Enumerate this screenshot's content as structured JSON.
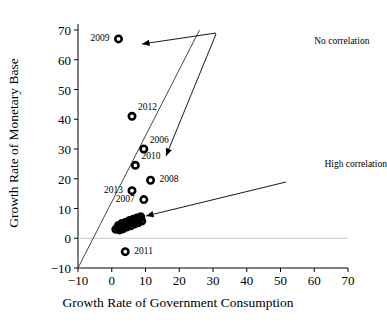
{
  "chart_data": {
    "type": "scatter",
    "title": "",
    "xlabel": "Growth Rate of Government Consumption",
    "ylabel": "Growth Rate of Monetary Base",
    "xlim": [
      -10,
      70
    ],
    "ylim": [
      -10,
      70
    ],
    "xticks": [
      "−10",
      "0",
      "10",
      "20",
      "30",
      "40",
      "50",
      "60",
      "70"
    ],
    "yticks": [
      "−10",
      "0",
      "10",
      "20",
      "30",
      "40",
      "50",
      "60",
      "70"
    ],
    "xtick_values": [
      -10,
      0,
      10,
      20,
      30,
      40,
      50,
      60,
      70
    ],
    "ytick_values": [
      -10,
      0,
      10,
      20,
      30,
      40,
      50,
      60,
      70
    ],
    "grid": false,
    "legend": "none",
    "marker": "open-circle",
    "marker_color": "#000000",
    "labeled_points": [
      {
        "label": "2009",
        "x": 2.0,
        "y": 67.0,
        "label_pos": "left"
      },
      {
        "label": "2012",
        "x": 6.0,
        "y": 41.0,
        "label_pos": "upper-right"
      },
      {
        "label": "2006",
        "x": 9.5,
        "y": 30.0,
        "label_pos": "upper-right"
      },
      {
        "label": "2010",
        "x": 7.0,
        "y": 24.5,
        "label_pos": "upper-right"
      },
      {
        "label": "2008",
        "x": 11.5,
        "y": 19.5,
        "label_pos": "right"
      },
      {
        "label": "2013",
        "x": 6.0,
        "y": 16.0,
        "label_pos": "left"
      },
      {
        "label": "2007",
        "x": 9.5,
        "y": 13.0,
        "label_pos": "left"
      },
      {
        "label": "2011",
        "x": 4.0,
        "y": -4.5,
        "label_pos": "right"
      }
    ],
    "cluster_points": [
      {
        "x": 1.2,
        "y": 3.0
      },
      {
        "x": 1.9,
        "y": 3.4
      },
      {
        "x": 2.4,
        "y": 2.8
      },
      {
        "x": 2.0,
        "y": 4.3
      },
      {
        "x": 2.8,
        "y": 4.0
      },
      {
        "x": 3.3,
        "y": 3.2
      },
      {
        "x": 3.0,
        "y": 5.0
      },
      {
        "x": 3.8,
        "y": 4.6
      },
      {
        "x": 4.4,
        "y": 3.8
      },
      {
        "x": 4.2,
        "y": 5.4
      },
      {
        "x": 5.0,
        "y": 5.0
      },
      {
        "x": 5.6,
        "y": 4.2
      },
      {
        "x": 5.3,
        "y": 6.0
      },
      {
        "x": 6.1,
        "y": 5.6
      },
      {
        "x": 6.7,
        "y": 4.8
      },
      {
        "x": 6.4,
        "y": 6.4
      },
      {
        "x": 7.2,
        "y": 6.0
      },
      {
        "x": 7.8,
        "y": 5.2
      },
      {
        "x": 7.5,
        "y": 6.8
      },
      {
        "x": 8.3,
        "y": 6.4
      },
      {
        "x": 8.9,
        "y": 5.8
      },
      {
        "x": 8.6,
        "y": 7.2
      }
    ],
    "trend_line": {
      "x1": -10.0,
      "y1": -10.0,
      "x2": 26.0,
      "y2": 70.0
    },
    "annotations": [
      {
        "text": "No correlation",
        "x": 60.0,
        "y": 66.0
      },
      {
        "text": "High correlation",
        "x": 63.0,
        "y": 24.5
      }
    ]
  },
  "annotation_labels": {
    "no_correlation": "No correlation",
    "high_correlation": "High correlation"
  },
  "axis": {
    "x_title": "Growth Rate of Government Consumption",
    "y_title": "Growth Rate of Monetary Base"
  },
  "ticks": {
    "x": [
      "−10",
      "0",
      "10",
      "20",
      "30",
      "40",
      "50",
      "60",
      "70"
    ],
    "y": [
      "−10",
      "0",
      "10",
      "20",
      "30",
      "40",
      "50",
      "60",
      "70"
    ]
  },
  "point_labels": {
    "p2009": "2009",
    "p2012": "2012",
    "p2006": "2006",
    "p2010": "2010",
    "p2008": "2008",
    "p2013": "2013",
    "p2007": "2007",
    "p2011": "2011"
  }
}
